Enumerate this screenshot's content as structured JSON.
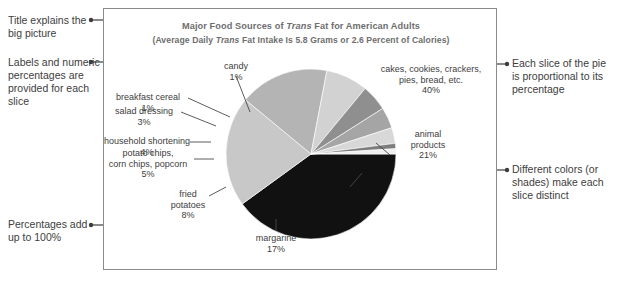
{
  "figure": {
    "title_prefix": "Major Food Sources of ",
    "title_italic": "Trans",
    "title_suffix": " Fat for American Adults",
    "subtitle_prefix": "(Average Daily ",
    "subtitle_italic": "Trans",
    "subtitle_suffix": " Fat Intake Is 5.8 Grams or 2.6 Percent of Calories)"
  },
  "annotations": {
    "left": [
      {
        "id": "title-note",
        "text": "Title explains the big picture"
      },
      {
        "id": "labels-note",
        "text": "Labels and numeric percentages are provided for each slice"
      },
      {
        "id": "total-note",
        "text": "Percentages add up to 100%"
      }
    ],
    "right": [
      {
        "id": "proportion-note",
        "text": "Each slice of the pie is proportional to its percentage"
      },
      {
        "id": "color-note",
        "text": "Different colors (or shades) make each slice distinct"
      }
    ]
  },
  "slice_labels": {
    "cakes": {
      "line1": "cakes, cookies, crackers,",
      "line2": "pies, bread, etc.",
      "value": "40%"
    },
    "animal": {
      "line1": "animal",
      "line2": "products",
      "value": "21%"
    },
    "margarine": {
      "line1": "margarine",
      "value": "17%"
    },
    "fried_potatoes": {
      "line1": "fried",
      "line2": "potatoes",
      "value": "8%"
    },
    "potato_chips": {
      "line1": "potato chips,",
      "line2": "corn chips, popcorn",
      "value": "5%"
    },
    "household_shortening": {
      "line1": "household shortening",
      "value": "4%"
    },
    "salad_dressing": {
      "line1": "salad dressing",
      "value": "3%"
    },
    "breakfast_cereal": {
      "line1": "breakfast cereal",
      "value": "1%"
    },
    "candy": {
      "line1": "candy",
      "value": "1%"
    }
  },
  "chart_data": {
    "type": "pie",
    "title": "Major Food Sources of Trans Fat for American Adults",
    "subtitle": "(Average Daily Trans Fat Intake Is 5.8 Grams or 2.6 Percent of Calories)",
    "categories": [
      "cakes, cookies, crackers, pies, bread, etc.",
      "animal products",
      "margarine",
      "fried potatoes",
      "potato chips, corn chips, popcorn",
      "household shortening",
      "salad dressing",
      "breakfast cereal",
      "candy"
    ],
    "values": [
      40,
      21,
      17,
      8,
      5,
      4,
      3,
      1,
      1
    ],
    "unit": "percent",
    "total": 100,
    "colors": [
      "#111111",
      "#c8c8c8",
      "#b4b4b4",
      "#d2d2d2",
      "#8f8f8f",
      "#a5a5a5",
      "#d8d8d8",
      "#7d7d7d",
      "#efefef"
    ],
    "start_angle_deg": 0,
    "direction": "clockwise",
    "legend": "none",
    "grid": false
  }
}
